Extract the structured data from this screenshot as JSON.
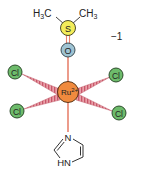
{
  "molecule": {
    "charge": "−1",
    "central_atom": {
      "symbol": "Ru",
      "charge": "2+",
      "color": "#f08a3e"
    },
    "dmso": {
      "methyl_left": {
        "text": "H",
        "sub": "3",
        "suffix": "C"
      },
      "methyl_right": {
        "text": "CH",
        "sub": "3"
      },
      "sulfur": {
        "symbol": "S",
        "color": "#f3ec5a"
      },
      "oxygen": {
        "symbol": "O",
        "color": "#9fc3d2"
      }
    },
    "chlorides": [
      {
        "symbol": "Cl",
        "position": "upper-left",
        "color": "#6dbb6b"
      },
      {
        "symbol": "Cl",
        "position": "upper-right",
        "color": "#6dbb6b"
      },
      {
        "symbol": "Cl",
        "position": "lower-left",
        "color": "#6dbb6b"
      },
      {
        "symbol": "Cl",
        "position": "lower-right",
        "color": "#6dbb6b"
      }
    ],
    "imidazole": {
      "n_top": "N",
      "nh_bottom": "HN"
    },
    "bond_color": "#e8836f",
    "wedge_color": "#c8566a"
  }
}
